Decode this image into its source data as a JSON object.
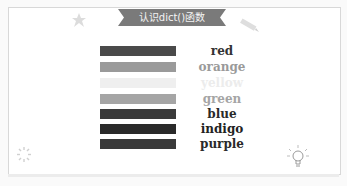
{
  "banner": {
    "title": "认识dict()函数"
  },
  "colors_list": [
    {
      "name": "red",
      "bar_color": "#4a4a4a",
      "text_color": "#333333"
    },
    {
      "name": "orange",
      "bar_color": "#9a9a9a",
      "text_color": "#9a9a9a"
    },
    {
      "name": "yellow",
      "bar_color": "#efefef",
      "text_color": "#ececec"
    },
    {
      "name": "green",
      "bar_color": "#a5a5a5",
      "text_color": "#a5a5a5"
    },
    {
      "name": "blue",
      "bar_color": "#3a3a3a",
      "text_color": "#2a2a2a"
    },
    {
      "name": "indigo",
      "bar_color": "#2a2a2a",
      "text_color": "#222222"
    },
    {
      "name": "purple",
      "bar_color": "#3a3a3a",
      "text_color": "#2a2a2a"
    }
  ],
  "icons": {
    "top_left": "star-icon",
    "top_right": "pencil-icon",
    "bottom_left": "sparkle-icon",
    "bottom_right": "lightbulb-icon"
  }
}
